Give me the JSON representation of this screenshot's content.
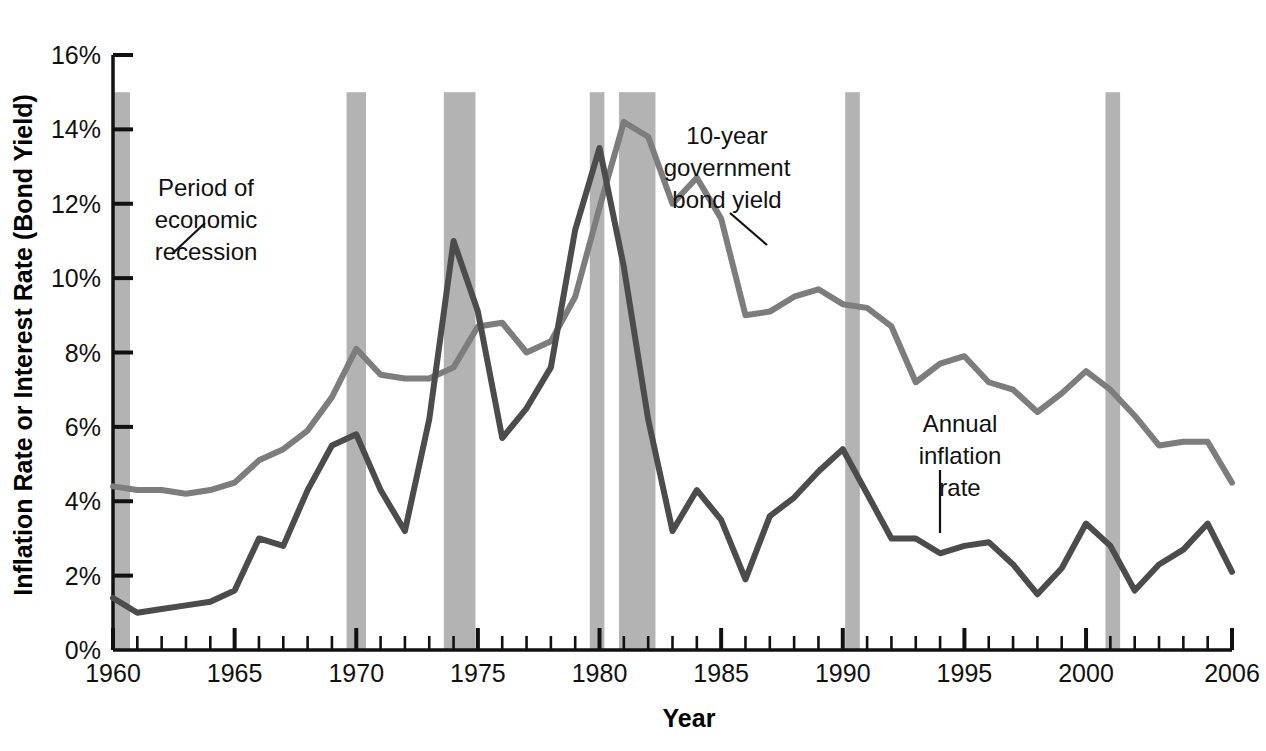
{
  "chart_data": {
    "type": "line",
    "title": "",
    "xlabel": "Year",
    "ylabel": "Inflation Rate or Interest Rate (Bond Yield)",
    "xlim": [
      1960,
      2006
    ],
    "ylim": [
      0,
      16
    ],
    "grid": false,
    "legend_position": "inline-annotations",
    "y_tick_labels": [
      "0%",
      "2%",
      "4%",
      "6%",
      "8%",
      "10%",
      "12%",
      "14%",
      "16%"
    ],
    "y_ticks": [
      0,
      2,
      4,
      6,
      8,
      10,
      12,
      14,
      16
    ],
    "x_tick_labels": [
      "1960",
      "1965",
      "1970",
      "1975",
      "1980",
      "1985",
      "1990",
      "1995",
      "2000",
      "2006"
    ],
    "x_ticks": [
      1960,
      1965,
      1970,
      1975,
      1980,
      1985,
      1990,
      1995,
      2000,
      2006
    ],
    "x_minor_tick_step": 1,
    "x": [
      1960,
      1961,
      1962,
      1963,
      1964,
      1965,
      1966,
      1967,
      1968,
      1969,
      1970,
      1971,
      1972,
      1973,
      1974,
      1975,
      1976,
      1977,
      1978,
      1979,
      1980,
      1981,
      1982,
      1983,
      1984,
      1985,
      1986,
      1987,
      1988,
      1989,
      1990,
      1991,
      1992,
      1993,
      1994,
      1995,
      1996,
      1997,
      1998,
      1999,
      2000,
      2001,
      2002,
      2003,
      2004,
      2005,
      2006
    ],
    "series": [
      {
        "name": "10-year government bond yield",
        "color": "#7d7d7d",
        "values": [
          4.4,
          4.3,
          4.3,
          4.2,
          4.3,
          4.5,
          5.1,
          5.4,
          5.9,
          6.8,
          8.1,
          7.4,
          7.3,
          7.3,
          7.6,
          8.7,
          8.8,
          8.0,
          8.3,
          9.5,
          11.9,
          14.2,
          13.8,
          12.0,
          12.7,
          11.6,
          9.0,
          9.1,
          9.5,
          9.7,
          9.3,
          9.2,
          8.7,
          7.2,
          7.7,
          7.9,
          7.2,
          7.0,
          6.4,
          6.9,
          7.5,
          7.0,
          6.3,
          5.5,
          5.6,
          5.6,
          4.5
        ]
      },
      {
        "name": "Annual inflation rate",
        "color": "#4c4c4c",
        "values": [
          1.4,
          1.0,
          1.1,
          1.2,
          1.3,
          1.6,
          3.0,
          2.8,
          4.3,
          5.5,
          5.8,
          4.3,
          3.2,
          6.2,
          11.0,
          9.1,
          5.7,
          6.5,
          7.6,
          11.3,
          13.5,
          10.3,
          6.2,
          3.2,
          4.3,
          3.5,
          1.9,
          3.6,
          4.1,
          4.8,
          5.4,
          4.2,
          3.0,
          3.0,
          2.6,
          2.8,
          2.9,
          2.3,
          1.5,
          2.2,
          3.4,
          2.8,
          1.6,
          2.3,
          2.7,
          3.4,
          2.1
        ]
      }
    ],
    "recession_bands": [
      {
        "start": 1960.0,
        "end": 1960.7,
        "label": "Period of economic recession"
      },
      {
        "start": 1969.6,
        "end": 1970.4,
        "label": "Period of economic recession"
      },
      {
        "start": 1973.6,
        "end": 1974.9,
        "label": "Period of economic recession"
      },
      {
        "start": 1979.6,
        "end": 1980.2,
        "label": "Period of economic recession"
      },
      {
        "start": 1980.8,
        "end": 1982.3,
        "label": "Period of economic recession"
      },
      {
        "start": 1990.1,
        "end": 1990.7,
        "label": "Period of economic recession"
      },
      {
        "start": 2000.8,
        "end": 2001.4,
        "label": "Period of economic recession"
      }
    ],
    "recession_band_top": 15.0,
    "recession_band_color": "#b3b3b3",
    "annotations": [
      {
        "id": "recession",
        "text_lines": [
          "Period of",
          "economic",
          "recession"
        ],
        "text_x": 206,
        "text_y": 196,
        "leader": [
          [
            172,
            254
          ],
          [
            205,
            223
          ]
        ]
      },
      {
        "id": "bond-yield",
        "text_lines": [
          "10-year",
          "government",
          "bond yield"
        ],
        "text_x": 727,
        "text_y": 144,
        "leader": [
          [
            767,
            245
          ],
          [
            730,
            213
          ]
        ]
      },
      {
        "id": "inflation",
        "text_lines": [
          "Annual",
          "inflation",
          "rate"
        ],
        "text_x": 960,
        "text_y": 432,
        "leader": [
          [
            940,
            533
          ],
          [
            940,
            470
          ]
        ]
      }
    ]
  }
}
